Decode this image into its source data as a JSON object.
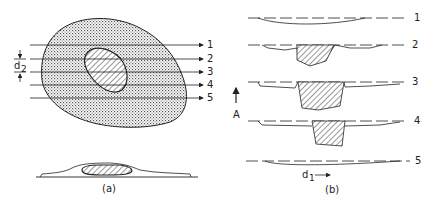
{
  "panel_a": {
    "caption": "(a)",
    "scan_labels": [
      "1",
      "2",
      "3",
      "4",
      "5"
    ],
    "spacing_label": "d",
    "spacing_sub": "2"
  },
  "panel_b": {
    "caption": "(b)",
    "profile_labels": [
      "1",
      "2",
      "3",
      "4",
      "5"
    ],
    "axis_label": "A",
    "distance_label": "d",
    "distance_sub": "1"
  },
  "colors": {
    "ink": "#222222",
    "fill": "#e6e6e6"
  }
}
